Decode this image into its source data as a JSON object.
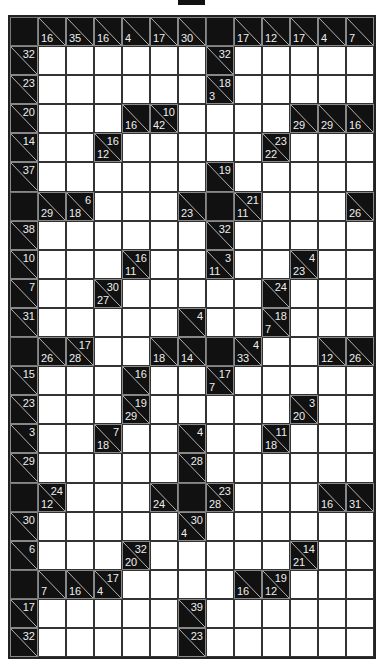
{
  "puzzle": {
    "type": "kakuro",
    "cols": 13,
    "rows": 22,
    "colors": {
      "block": "#111111",
      "cell": "#ffffff",
      "clue_text": "#eeeeee",
      "grid_line": "#333333"
    },
    "clues": [
      {
        "r": 0,
        "c": 0,
        "kind": "black"
      },
      {
        "r": 0,
        "c": 1,
        "down": "16"
      },
      {
        "r": 0,
        "c": 2,
        "down": "35"
      },
      {
        "r": 0,
        "c": 3,
        "down": "16"
      },
      {
        "r": 0,
        "c": 4,
        "down": "4"
      },
      {
        "r": 0,
        "c": 5,
        "down": "17"
      },
      {
        "r": 0,
        "c": 6,
        "down": "30"
      },
      {
        "r": 0,
        "c": 7,
        "kind": "black"
      },
      {
        "r": 0,
        "c": 8,
        "down": "17"
      },
      {
        "r": 0,
        "c": 9,
        "down": "12"
      },
      {
        "r": 0,
        "c": 10,
        "down": "17"
      },
      {
        "r": 0,
        "c": 11,
        "down": "4"
      },
      {
        "r": 0,
        "c": 12,
        "down": "7"
      },
      {
        "r": 1,
        "c": 0,
        "right": "32"
      },
      {
        "r": 1,
        "c": 7,
        "right": "32"
      },
      {
        "r": 2,
        "c": 0,
        "right": "23"
      },
      {
        "r": 2,
        "c": 7,
        "right": "18",
        "down": "3"
      },
      {
        "r": 3,
        "c": 0,
        "right": "20"
      },
      {
        "r": 3,
        "c": 4,
        "down": "16"
      },
      {
        "r": 3,
        "c": 5,
        "right": "10",
        "down": "42"
      },
      {
        "r": 3,
        "c": 10,
        "down": "29"
      },
      {
        "r": 3,
        "c": 11,
        "down": "29"
      },
      {
        "r": 3,
        "c": 12,
        "down": "16"
      },
      {
        "r": 4,
        "c": 0,
        "right": "14"
      },
      {
        "r": 4,
        "c": 3,
        "right": "16",
        "down": "12"
      },
      {
        "r": 4,
        "c": 9,
        "right": "23",
        "down": "22"
      },
      {
        "r": 5,
        "c": 0,
        "right": "37"
      },
      {
        "r": 5,
        "c": 7,
        "right": "19"
      },
      {
        "r": 6,
        "c": 0,
        "kind": "black"
      },
      {
        "r": 6,
        "c": 1,
        "down": "29"
      },
      {
        "r": 6,
        "c": 2,
        "right": "6",
        "down": "18"
      },
      {
        "r": 6,
        "c": 6,
        "down": "23"
      },
      {
        "r": 6,
        "c": 7,
        "kind": "black"
      },
      {
        "r": 6,
        "c": 8,
        "right": "21",
        "down": "11"
      },
      {
        "r": 6,
        "c": 12,
        "down": "26"
      },
      {
        "r": 7,
        "c": 0,
        "right": "38"
      },
      {
        "r": 7,
        "c": 7,
        "right": "32"
      },
      {
        "r": 8,
        "c": 0,
        "right": "10"
      },
      {
        "r": 8,
        "c": 4,
        "right": "16",
        "down": "11"
      },
      {
        "r": 8,
        "c": 7,
        "right": "3",
        "down": "11"
      },
      {
        "r": 8,
        "c": 10,
        "right": "4",
        "down": "23"
      },
      {
        "r": 9,
        "c": 0,
        "right": "7"
      },
      {
        "r": 9,
        "c": 3,
        "right": "30",
        "down": "27"
      },
      {
        "r": 9,
        "c": 9,
        "right": "24"
      },
      {
        "r": 10,
        "c": 0,
        "right": "31"
      },
      {
        "r": 10,
        "c": 6,
        "right": "4"
      },
      {
        "r": 10,
        "c": 9,
        "right": "18",
        "down": "7"
      },
      {
        "r": 11,
        "c": 0,
        "kind": "black"
      },
      {
        "r": 11,
        "c": 1,
        "down": "26"
      },
      {
        "r": 11,
        "c": 2,
        "right": "17",
        "down": "28"
      },
      {
        "r": 11,
        "c": 5,
        "down": "18"
      },
      {
        "r": 11,
        "c": 6,
        "down": "14"
      },
      {
        "r": 11,
        "c": 7,
        "kind": "black"
      },
      {
        "r": 11,
        "c": 8,
        "right": "4",
        "down": "33"
      },
      {
        "r": 11,
        "c": 11,
        "down": "12"
      },
      {
        "r": 11,
        "c": 12,
        "down": "26"
      },
      {
        "r": 12,
        "c": 0,
        "right": "15"
      },
      {
        "r": 12,
        "c": 4,
        "right": "16"
      },
      {
        "r": 12,
        "c": 7,
        "right": "17",
        "down": "7"
      },
      {
        "r": 13,
        "c": 0,
        "right": "23"
      },
      {
        "r": 13,
        "c": 4,
        "right": "19",
        "down": "29"
      },
      {
        "r": 13,
        "c": 10,
        "right": "3",
        "down": "20"
      },
      {
        "r": 14,
        "c": 0,
        "right": "3"
      },
      {
        "r": 14,
        "c": 3,
        "right": "7",
        "down": "18"
      },
      {
        "r": 14,
        "c": 6,
        "right": "4"
      },
      {
        "r": 14,
        "c": 9,
        "right": "11",
        "down": "18"
      },
      {
        "r": 15,
        "c": 0,
        "right": "29"
      },
      {
        "r": 15,
        "c": 6,
        "right": "28"
      },
      {
        "r": 16,
        "c": 0,
        "kind": "black"
      },
      {
        "r": 16,
        "c": 1,
        "right": "24",
        "down": "12"
      },
      {
        "r": 16,
        "c": 5,
        "down": "24"
      },
      {
        "r": 16,
        "c": 6,
        "kind": "black"
      },
      {
        "r": 16,
        "c": 7,
        "right": "23",
        "down": "28"
      },
      {
        "r": 16,
        "c": 11,
        "down": "16"
      },
      {
        "r": 16,
        "c": 12,
        "down": "31"
      },
      {
        "r": 17,
        "c": 0,
        "right": "30"
      },
      {
        "r": 17,
        "c": 6,
        "right": "30",
        "down": "4"
      },
      {
        "r": 18,
        "c": 0,
        "right": "6"
      },
      {
        "r": 18,
        "c": 4,
        "right": "32",
        "down": "20"
      },
      {
        "r": 18,
        "c": 10,
        "right": "14",
        "down": "21"
      },
      {
        "r": 19,
        "c": 0,
        "kind": "black"
      },
      {
        "r": 19,
        "c": 1,
        "down": "7"
      },
      {
        "r": 19,
        "c": 2,
        "down": "16"
      },
      {
        "r": 19,
        "c": 3,
        "right": "17",
        "down": "4"
      },
      {
        "r": 19,
        "c": 8,
        "down": "16"
      },
      {
        "r": 19,
        "c": 9,
        "right": "19",
        "down": "12"
      },
      {
        "r": 20,
        "c": 0,
        "right": "17"
      },
      {
        "r": 20,
        "c": 6,
        "right": "39"
      },
      {
        "r": 21,
        "c": 0,
        "right": "32"
      },
      {
        "r": 21,
        "c": 6,
        "right": "23"
      }
    ]
  }
}
